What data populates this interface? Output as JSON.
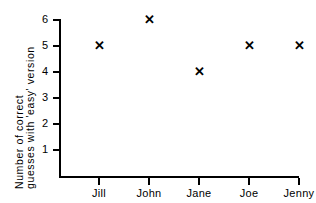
{
  "chart_data": {
    "type": "scatter",
    "title": "",
    "subtitle": "",
    "xlabel": "",
    "ylabel": "Number of correct guesses with 'easy' version",
    "ylabel_lines": [
      "Number of correct",
      "guesses with 'easy' version"
    ],
    "categories": [
      "Jill",
      "John",
      "Jane",
      "Joe",
      "Jenny"
    ],
    "values": [
      5,
      6,
      4,
      5,
      5
    ],
    "points": [
      {
        "category": "Jill",
        "value": 5
      },
      {
        "category": "John",
        "value": 6
      },
      {
        "category": "Jane",
        "value": 4
      },
      {
        "category": "Joe",
        "value": 5
      },
      {
        "category": "Jenny",
        "value": 5
      }
    ],
    "ytick_labels": [
      "1",
      "2",
      "3",
      "4",
      "5",
      "6"
    ],
    "ytick_values": [
      1,
      2,
      3,
      4,
      5,
      6
    ],
    "ylim": [
      0,
      6
    ],
    "grid": false,
    "legend": false,
    "marker": "cross-x",
    "marker_glyph": "✕",
    "colors": {
      "ink": "#000000",
      "background": "#ffffff",
      "marker": "#000000"
    }
  }
}
